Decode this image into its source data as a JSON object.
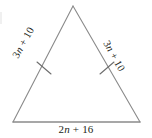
{
  "figure": {
    "shape": "triangle",
    "stroke_color": "#8a8a8a",
    "text_color": "#231f20",
    "background_color": "#ffffff",
    "vertices": {
      "apex": {
        "x": 73,
        "y": 6
      },
      "bottom_left": {
        "x": 13,
        "y": 122
      },
      "bottom_right": {
        "x": 140,
        "y": 122
      }
    },
    "tick_marks": {
      "count": 2,
      "description": "single congruence tick on each of the two legs",
      "positions": [
        {
          "x": 44,
          "y": 68
        },
        {
          "x": 107,
          "y": 68
        }
      ]
    },
    "labels": {
      "left_side": {
        "full": "3n + 10",
        "coefficient": "3",
        "variable": "n",
        "operator": "+",
        "constant": "10",
        "rotation_deg": -61
      },
      "right_side": {
        "full": "3n + 10",
        "coefficient": "3",
        "variable": "n",
        "operator": "+",
        "constant": "10",
        "rotation_deg": 61
      },
      "bottom_side": {
        "full": "2n + 16",
        "coefficient": "2",
        "variable": "n",
        "operator": "+",
        "constant": "16",
        "rotation_deg": 0
      }
    }
  }
}
